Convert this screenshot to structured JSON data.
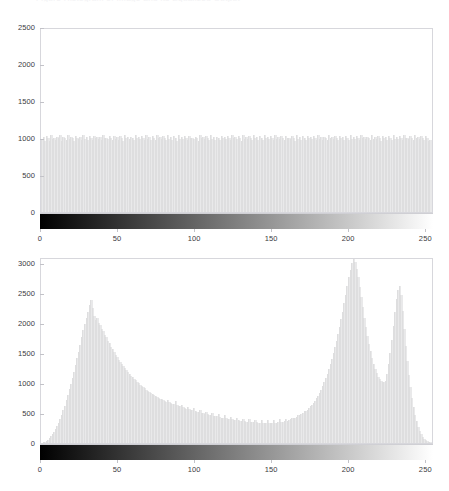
{
  "figure": {
    "title_clipped": "Figure  Histogram  of  Image  and  its  Equalized  Output",
    "background": "#ffffff",
    "bar_color": "#e9e9ea",
    "axis_color": "#d7d7dc",
    "tick_label_color": "#3b3b42",
    "colorbar_start": "#000000",
    "colorbar_end": "#ffffff"
  },
  "chart_data": [
    {
      "type": "bar",
      "title": "",
      "subtitle": "Equalized (uniform) histogram with grayscale colorbar",
      "xlabel": "",
      "ylabel": "",
      "xlim": [
        0,
        255
      ],
      "ylim": [
        0,
        2500
      ],
      "xticks": [
        0,
        50,
        100,
        150,
        200,
        250
      ],
      "yticks": [
        0,
        500,
        1000,
        1500,
        2000,
        2500
      ],
      "xtick_labels": [
        "0",
        "50",
        "100",
        "150",
        "200",
        "250"
      ],
      "ytick_labels": [
        "0",
        "500",
        "1000",
        "1500",
        "2000",
        "2500"
      ],
      "grid": false,
      "legend": null,
      "colorbar": {
        "orientation": "horizontal",
        "cmap": "gray",
        "vmin": 0,
        "vmax": 255
      },
      "bin_width": 1,
      "categories": [
        0,
        1,
        2,
        3,
        4,
        5,
        6,
        7,
        8,
        9,
        10,
        11,
        12,
        13,
        14,
        15,
        16,
        17,
        18,
        19,
        20,
        21,
        22,
        23,
        24,
        25,
        26,
        27,
        28,
        29,
        30,
        31,
        32,
        33,
        34,
        35,
        36,
        37,
        38,
        39,
        40,
        41,
        42,
        43,
        44,
        45,
        46,
        47,
        48,
        49,
        50,
        51,
        52,
        53,
        54,
        55,
        56,
        57,
        58,
        59,
        60,
        61,
        62,
        63,
        64,
        65,
        66,
        67,
        68,
        69,
        70,
        71,
        72,
        73,
        74,
        75,
        76,
        77,
        78,
        79,
        80,
        81,
        82,
        83,
        84,
        85,
        86,
        87,
        88,
        89,
        90,
        91,
        92,
        93,
        94,
        95,
        96,
        97,
        98,
        99,
        100,
        101,
        102,
        103,
        104,
        105,
        106,
        107,
        108,
        109,
        110,
        111,
        112,
        113,
        114,
        115,
        116,
        117,
        118,
        119,
        120,
        121,
        122,
        123,
        124,
        125,
        126,
        127,
        128,
        129,
        130,
        131,
        132,
        133,
        134,
        135,
        136,
        137,
        138,
        139,
        140,
        141,
        142,
        143,
        144,
        145,
        146,
        147,
        148,
        149,
        150,
        151,
        152,
        153,
        154,
        155,
        156,
        157,
        158,
        159,
        160,
        161,
        162,
        163,
        164,
        165,
        166,
        167,
        168,
        169,
        170,
        171,
        172,
        173,
        174,
        175,
        176,
        177,
        178,
        179,
        180,
        181,
        182,
        183,
        184,
        185,
        186,
        187,
        188,
        189,
        190,
        191,
        192,
        193,
        194,
        195,
        196,
        197,
        198,
        199,
        200,
        201,
        202,
        203,
        204,
        205,
        206,
        207,
        208,
        209,
        210,
        211,
        212,
        213,
        214,
        215,
        216,
        217,
        218,
        219,
        220,
        221,
        222,
        223,
        224,
        225,
        226,
        227,
        228,
        229,
        230,
        231,
        232,
        233,
        234,
        235,
        236,
        237,
        238,
        239,
        240,
        241,
        242,
        243,
        244,
        245,
        246,
        247,
        248,
        249,
        250,
        251,
        252,
        253,
        254,
        255
      ],
      "values": [
        980,
        1010,
        955,
        1030,
        1000,
        965,
        1045,
        990,
        1005,
        970,
        1020,
        995,
        1035,
        960,
        1008,
        1002,
        975,
        1040,
        988,
        1012,
        998,
        966,
        1028,
        1001,
        984,
        1015,
        972,
        1036,
        993,
        1007,
        979,
        1022,
        1004,
        968,
        1031,
        996,
        1010,
        983,
        1017,
        974,
        1038,
        999,
        1006,
        986,
        1024,
        1000,
        970,
        1033,
        991,
        1013,
        977,
        1029,
        1002,
        963,
        1042,
        994,
        1009,
        981,
        1019,
        1003,
        969,
        1035,
        997,
        1011,
        985,
        1026,
        1000,
        973,
        1037,
        992,
        1014,
        978,
        1030,
        1005,
        967,
        1041,
        995,
        1008,
        982,
        1021,
        1001,
        971,
        1034,
        989,
        1016,
        976,
        1027,
        1000,
        964,
        1039,
        993,
        1010,
        987,
        1023,
        1002,
        968,
        1032,
        998,
        1006,
        980,
        1018,
        1004,
        965,
        1043,
        996,
        1012,
        984,
        1025,
        999,
        974,
        1036,
        990,
        1009,
        979,
        1020,
        1003,
        969,
        1031,
        997,
        1013,
        986,
        1028,
        1000,
        972,
        1038,
        994,
        1007,
        981,
        1022,
        1005,
        966,
        1034,
        992,
        1011,
        983,
        1024,
        1001,
        975,
        1040,
        998,
        1008,
        977,
        1029,
        1002,
        970,
        1035,
        996,
        1015,
        985,
        1026,
        1000,
        968,
        1037,
        991,
        1010,
        980,
        1021,
        1004,
        973,
        1033,
        995,
        1006,
        982,
        1027,
        999,
        965,
        1042,
        993,
        1012,
        978,
        1023,
        1003,
        971,
        1030,
        997,
        1009,
        986,
        1025,
        1000,
        974,
        1039,
        990,
        1014,
        979,
        1019,
        1005,
        967,
        1036,
        994,
        1008,
        983,
        1028,
        1001,
        972,
        1031,
        998,
        1010,
        976,
        1022,
        1002,
        969,
        1041,
        992,
        1013,
        984,
        1026,
        1000,
        970,
        1034,
        996,
        1007,
        981,
        1020,
        1004,
        975,
        1038,
        993,
        1011,
        987,
        1029,
        999,
        966,
        1032,
        995,
        1009,
        978,
        1024,
        1003,
        971,
        1040,
        991,
        1015,
        985,
        1021,
        1000,
        973,
        1035,
        997,
        1006,
        982,
        1027,
        1002,
        968,
        1037,
        994,
        1012,
        980,
        1023,
        1001,
        976,
        1030,
        998,
        960,
        975
      ]
    },
    {
      "type": "bar",
      "title": "",
      "subtitle": "Original image histogram with grayscale colorbar",
      "xlabel": "",
      "ylabel": "",
      "xlim": [
        0,
        255
      ],
      "ylim": [
        0,
        3100
      ],
      "xticks": [
        0,
        50,
        100,
        150,
        200,
        250
      ],
      "yticks": [
        0,
        500,
        1000,
        1500,
        2000,
        2500,
        3000
      ],
      "xtick_labels": [
        "0",
        "50",
        "100",
        "150",
        "200",
        "250"
      ],
      "ytick_labels": [
        "0",
        "500",
        "1000",
        "1500",
        "2000",
        "2500",
        "3000"
      ],
      "grid": false,
      "legend": null,
      "colorbar": {
        "orientation": "horizontal",
        "cmap": "gray",
        "vmin": 0,
        "vmax": 255
      },
      "bin_width": 1,
      "peaks": [
        {
          "x": 32,
          "y": 2380,
          "label": "dark mode"
        },
        {
          "x": 200,
          "y": 3090,
          "label": "bright mode"
        },
        {
          "x": 231,
          "y": 2620,
          "label": "highlight mode"
        }
      ],
      "categories": [
        0,
        1,
        2,
        3,
        4,
        5,
        6,
        7,
        8,
        9,
        10,
        11,
        12,
        13,
        14,
        15,
        16,
        17,
        18,
        19,
        20,
        21,
        22,
        23,
        24,
        25,
        26,
        27,
        28,
        29,
        30,
        31,
        32,
        33,
        34,
        35,
        36,
        37,
        38,
        39,
        40,
        41,
        42,
        43,
        44,
        45,
        46,
        47,
        48,
        49,
        50,
        51,
        52,
        53,
        54,
        55,
        56,
        57,
        58,
        59,
        60,
        61,
        62,
        63,
        64,
        65,
        66,
        67,
        68,
        69,
        70,
        71,
        72,
        73,
        74,
        75,
        76,
        77,
        78,
        79,
        80,
        81,
        82,
        83,
        84,
        85,
        86,
        87,
        88,
        89,
        90,
        91,
        92,
        93,
        94,
        95,
        96,
        97,
        98,
        99,
        100,
        101,
        102,
        103,
        104,
        105,
        106,
        107,
        108,
        109,
        110,
        111,
        112,
        113,
        114,
        115,
        116,
        117,
        118,
        119,
        120,
        121,
        122,
        123,
        124,
        125,
        126,
        127,
        128,
        129,
        130,
        131,
        132,
        133,
        134,
        135,
        136,
        137,
        138,
        139,
        140,
        141,
        142,
        143,
        144,
        145,
        146,
        147,
        148,
        149,
        150,
        151,
        152,
        153,
        154,
        155,
        156,
        157,
        158,
        159,
        160,
        161,
        162,
        163,
        164,
        165,
        166,
        167,
        168,
        169,
        170,
        171,
        172,
        173,
        174,
        175,
        176,
        177,
        178,
        179,
        180,
        181,
        182,
        183,
        184,
        185,
        186,
        187,
        188,
        189,
        190,
        191,
        192,
        193,
        194,
        195,
        196,
        197,
        198,
        199,
        200,
        201,
        202,
        203,
        204,
        205,
        206,
        207,
        208,
        209,
        210,
        211,
        212,
        213,
        214,
        215,
        216,
        217,
        218,
        219,
        220,
        221,
        222,
        223,
        224,
        225,
        226,
        227,
        228,
        229,
        230,
        231,
        232,
        233,
        234,
        235,
        236,
        237,
        238,
        239,
        240,
        241,
        242,
        243,
        244,
        245,
        246,
        247,
        248,
        249,
        250,
        251,
        252,
        253,
        254,
        255
      ],
      "values": [
        5,
        10,
        20,
        35,
        55,
        80,
        110,
        145,
        185,
        230,
        280,
        340,
        400,
        470,
        545,
        625,
        710,
        800,
        895,
        990,
        1090,
        1190,
        1300,
        1410,
        1520,
        1640,
        1760,
        1880,
        1990,
        2090,
        2180,
        2300,
        2380,
        2250,
        2120,
        2050,
        2090,
        2000,
        1960,
        1900,
        1870,
        1800,
        1760,
        1700,
        1660,
        1600,
        1560,
        1510,
        1470,
        1430,
        1390,
        1350,
        1320,
        1280,
        1250,
        1215,
        1185,
        1150,
        1125,
        1095,
        1070,
        1045,
        1020,
        1000,
        975,
        955,
        930,
        910,
        890,
        870,
        855,
        835,
        820,
        800,
        785,
        770,
        755,
        740,
        730,
        715,
        700,
        690,
        720,
        680,
        665,
        655,
        645,
        700,
        630,
        620,
        610,
        640,
        595,
        585,
        575,
        600,
        560,
        550,
        545,
        580,
        530,
        520,
        515,
        555,
        500,
        495,
        490,
        525,
        478,
        470,
        465,
        500,
        455,
        448,
        442,
        480,
        432,
        425,
        420,
        460,
        412,
        405,
        400,
        440,
        393,
        388,
        383,
        420,
        376,
        372,
        368,
        405,
        362,
        358,
        355,
        398,
        350,
        347,
        345,
        390,
        342,
        340,
        338,
        385,
        336,
        335,
        334,
        382,
        333,
        333,
        334,
        385,
        336,
        339,
        342,
        392,
        348,
        355,
        362,
        400,
        372,
        382,
        393,
        420,
        410,
        425,
        440,
        470,
        460,
        478,
        496,
        530,
        530,
        556,
        584,
        620,
        630,
        665,
        700,
        745,
        790,
        840,
        890,
        950,
        1010,
        1080,
        1150,
        1230,
        1320,
        1400,
        1500,
        1600,
        1700,
        1820,
        1940,
        2060,
        2190,
        2330,
        2470,
        2620,
        2760,
        2890,
        3000,
        3090,
        3020,
        2900,
        2760,
        2600,
        2430,
        2260,
        2090,
        1930,
        1790,
        1650,
        1530,
        1420,
        1320,
        1230,
        1160,
        1100,
        1060,
        1030,
        1015,
        1010,
        1040,
        1150,
        1310,
        1500,
        1720,
        1950,
        2180,
        2400,
        2550,
        2620,
        2460,
        2200,
        1900,
        1620,
        1360,
        1130,
        930,
        750,
        600,
        470,
        360,
        270,
        200,
        145,
        100,
        68,
        44,
        28,
        16,
        9,
        4,
        2,
        1,
        1,
        0
      ]
    }
  ]
}
